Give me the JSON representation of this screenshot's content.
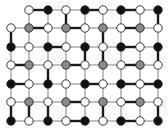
{
  "diagram": {
    "title": "",
    "columns_x": [
      11,
      29,
      48,
      66,
      85,
      103,
      121,
      140,
      158
    ],
    "rows_y": [
      10,
      28,
      47,
      65,
      84,
      102,
      121
    ],
    "node_radius": 4.2,
    "colors": {
      "W": "#ffffff",
      "B": "#111111",
      "G": "#8a8a8a",
      "stroke": "#222222",
      "thin_edge": "#8c8c8c",
      "thick_edge": "#1a1a1a"
    },
    "grid": [
      [
        "-",
        "W",
        "B",
        "W",
        "B",
        "W",
        "B",
        "W",
        "B"
      ],
      [
        "W",
        "G",
        "W",
        "G",
        "W",
        "G",
        "W",
        "G",
        "W"
      ],
      [
        "B",
        "W",
        "B",
        "W",
        "B",
        "W",
        "B",
        "W",
        "B"
      ],
      [
        "W",
        "G",
        "W",
        "G",
        "W",
        "G",
        "W",
        "G",
        "W"
      ],
      [
        "B",
        "W",
        "B",
        "W",
        "B",
        "W",
        "B",
        "W",
        "B"
      ],
      [
        "W",
        "G",
        "W",
        "G",
        "W",
        "G",
        "W",
        "G",
        "W"
      ],
      [
        "B",
        "W",
        "B",
        "W",
        "B",
        "W",
        "B",
        "W",
        "B"
      ]
    ],
    "thick_edges": [
      [
        [
          0,
          1
        ],
        [
          0,
          2
        ]
      ],
      [
        [
          0,
          4
        ],
        [
          0,
          5
        ]
      ],
      [
        [
          0,
          6
        ],
        [
          0,
          7
        ]
      ],
      [
        [
          0,
          8
        ],
        [
          1,
          8
        ]
      ],
      [
        [
          1,
          0
        ],
        [
          2,
          0
        ]
      ],
      [
        [
          1,
          1
        ],
        [
          1,
          2
        ]
      ],
      [
        [
          1,
          3
        ],
        [
          1,
          4
        ]
      ],
      [
        [
          0,
          3
        ],
        [
          1,
          3
        ]
      ],
      [
        [
          1,
          5
        ],
        [
          2,
          5
        ]
      ],
      [
        [
          1,
          6
        ],
        [
          1,
          7
        ]
      ],
      [
        [
          2,
          2
        ],
        [
          2,
          3
        ]
      ],
      [
        [
          2,
          6
        ],
        [
          2,
          7
        ]
      ],
      [
        [
          2,
          4
        ],
        [
          3,
          4
        ]
      ],
      [
        [
          2,
          8
        ],
        [
          3,
          8
        ]
      ],
      [
        [
          3,
          0
        ],
        [
          3,
          1
        ]
      ],
      [
        [
          3,
          2
        ],
        [
          4,
          2
        ]
      ],
      [
        [
          3,
          3
        ],
        [
          3,
          4
        ]
      ],
      [
        [
          3,
          5
        ],
        [
          2,
          5
        ]
      ],
      [
        [
          3,
          6
        ],
        [
          3,
          7
        ]
      ],
      [
        [
          4,
          0
        ],
        [
          4,
          1
        ]
      ],
      [
        [
          4,
          4
        ],
        [
          4,
          5
        ]
      ],
      [
        [
          4,
          6
        ],
        [
          4,
          7
        ]
      ],
      [
        [
          4,
          8
        ],
        [
          4,
          7
        ]
      ],
      [
        [
          5,
          0
        ],
        [
          6,
          0
        ]
      ],
      [
        [
          5,
          1
        ],
        [
          6,
          1
        ]
      ],
      [
        [
          5,
          2
        ],
        [
          6,
          2
        ]
      ],
      [
        [
          5,
          3
        ],
        [
          5,
          4
        ]
      ],
      [
        [
          5,
          5
        ],
        [
          6,
          5
        ]
      ],
      [
        [
          5,
          6
        ],
        [
          5,
          7
        ]
      ],
      [
        [
          5,
          8
        ],
        [
          6,
          8
        ]
      ],
      [
        [
          6,
          3
        ],
        [
          6,
          4
        ]
      ],
      [
        [
          6,
          6
        ],
        [
          6,
          7
        ]
      ]
    ]
  }
}
